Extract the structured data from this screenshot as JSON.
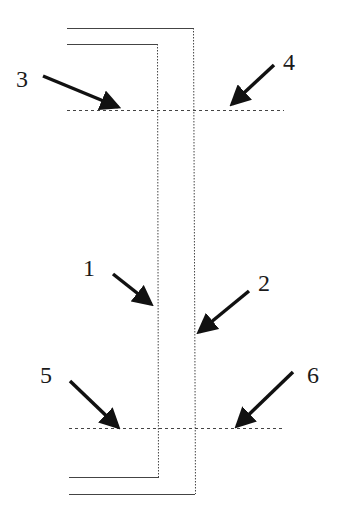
{
  "diagram": {
    "labels": [
      {
        "id": "1",
        "text": "1"
      },
      {
        "id": "2",
        "text": "2"
      },
      {
        "id": "3",
        "text": "3"
      },
      {
        "id": "4",
        "text": "4"
      },
      {
        "id": "5",
        "text": "5"
      },
      {
        "id": "6",
        "text": "6"
      }
    ],
    "colors": {
      "line": "#333333",
      "arrow": "#111111",
      "background": "#ffffff"
    }
  }
}
